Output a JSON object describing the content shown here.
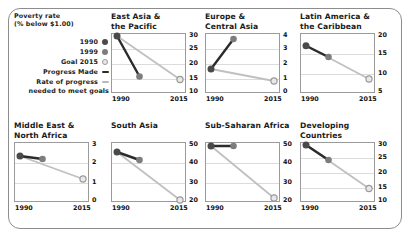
{
  "legend": {
    "title_line1": "Poverty rate",
    "title_line2": "(% below $1.00)",
    "items": [
      {
        "label": "1990",
        "marker": "filled-dark-circle-icon"
      },
      {
        "label": "1999",
        "marker": "filled-gray-circle-icon"
      },
      {
        "label": "Goal 2015",
        "marker": "hollow-ring-circle-icon"
      },
      {
        "label": "Progress Made",
        "marker": "dark-dash-icon"
      },
      {
        "label": "Rate of progress",
        "marker": "light-dash-icon"
      }
    ],
    "footnote": "needed to meet goals"
  },
  "colors": {
    "marker_1990": "#4a4a4a",
    "marker_1999": "#7d7d7d",
    "marker_goal_fill": "#e8e8e8",
    "marker_goal_stroke": "#9a9a9a",
    "line_progress_made": "#2b2b2b",
    "line_rate_needed": "#c0c0c0",
    "grid": "#dcdcdc",
    "axis": "#9b9b9b",
    "frame": "#8d8d8d"
  },
  "chart_data": {
    "type": "line",
    "title": "Poverty rate (% below $1.00)",
    "xlabel": "",
    "ylabel": "Poverty rate (% below $1.00)",
    "x": [
      "1990",
      "2015"
    ],
    "xticks": [
      "1990",
      "2015"
    ],
    "grid": true,
    "legend_position": "left",
    "series_names": [
      "Progress Made",
      "Rate of progress needed to meet goals"
    ],
    "point_names": [
      "1990",
      "1999",
      "Goal 2015"
    ],
    "panels": [
      {
        "title_line1": "East Asia &",
        "title_line2": "the Pacific",
        "ylim": [
          10,
          30
        ],
        "yticks": [
          10,
          15,
          20,
          25,
          30
        ],
        "values": {
          "1990": 29.0,
          "1999": 15.5,
          "goal_2015": 14.5
        },
        "x_positions": {
          "1990": 0.08,
          "1999": 0.38,
          "goal_2015": 0.92
        }
      },
      {
        "title_line1": "Europe &",
        "title_line2": "Central Asia",
        "ylim": [
          0,
          4
        ],
        "yticks": [
          0,
          1,
          2,
          3,
          4
        ],
        "values": {
          "1990": 1.6,
          "1999": 3.6,
          "goal_2015": 0.8
        },
        "x_positions": {
          "1990": 0.08,
          "1999": 0.38,
          "goal_2015": 0.92
        }
      },
      {
        "title_line1": "Latin America &",
        "title_line2": "the Caribbean",
        "ylim": [
          5,
          20
        ],
        "yticks": [
          5,
          10,
          15,
          20
        ],
        "values": {
          "1990": 16.8,
          "1999": 14.0,
          "goal_2015": 8.5
        },
        "x_positions": {
          "1990": 0.08,
          "1999": 0.38,
          "goal_2015": 0.92
        }
      },
      {
        "title_line1": "Middle East &",
        "title_line2": "North Africa",
        "ylim": [
          0,
          3
        ],
        "yticks": [
          0,
          1,
          2,
          3
        ],
        "values": {
          "1990": 2.3,
          "1999": 2.15,
          "goal_2015": 1.15
        },
        "x_positions": {
          "1990": 0.08,
          "1999": 0.38,
          "goal_2015": 0.92
        }
      },
      {
        "title_line1": "South Asia",
        "title_line2": "",
        "ylim": [
          20,
          50
        ],
        "yticks": [
          20,
          30,
          40,
          50
        ],
        "values": {
          "1990": 45.0,
          "1999": 41.0,
          "goal_2015": 21.0
        },
        "x_positions": {
          "1990": 0.08,
          "1999": 0.38,
          "goal_2015": 0.92
        }
      },
      {
        "title_line1": "Sub-Saharan Africa",
        "title_line2": "",
        "ylim": [
          20,
          50
        ],
        "yticks": [
          20,
          30,
          40,
          50
        ],
        "values": {
          "1990": 48.0,
          "1999": 48.0,
          "goal_2015": 22.0
        },
        "x_positions": {
          "1990": 0.08,
          "1999": 0.38,
          "goal_2015": 0.92
        }
      },
      {
        "title_line1": "Developing",
        "title_line2": "Countries",
        "ylim": [
          10,
          30
        ],
        "yticks": [
          10,
          15,
          20,
          25,
          30
        ],
        "values": {
          "1990": 29.0,
          "1999": 24.0,
          "goal_2015": 14.5
        },
        "x_positions": {
          "1990": 0.08,
          "1999": 0.38,
          "goal_2015": 0.92
        }
      }
    ]
  }
}
